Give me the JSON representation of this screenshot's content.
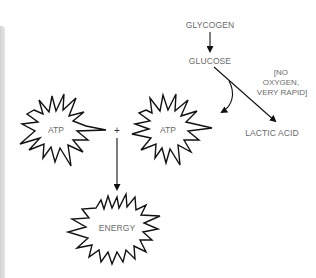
{
  "diagram": {
    "type": "metabolic-pathway",
    "nodes": {
      "glycogen": {
        "label": "GLYCOGEN"
      },
      "glucose": {
        "label": "GLUCOSE"
      },
      "condition": {
        "lines": [
          "[NO",
          "OXYGEN,",
          "VERY RAPID]"
        ]
      },
      "lactic_acid": {
        "label": "LACTIC ACID"
      },
      "atp_left": {
        "label": "ATP"
      },
      "atp_right": {
        "label": "ATP"
      },
      "plus": {
        "label": "+"
      },
      "energy": {
        "label": "ENERGY"
      }
    },
    "edges": [
      {
        "from": "GLYCOGEN",
        "to": "GLUCOSE"
      },
      {
        "from": "GLUCOSE",
        "to": "LACTIC ACID"
      },
      {
        "from": "GLUCOSE",
        "to": "ATP"
      },
      {
        "from": "ATP + ATP",
        "to": "ENERGY"
      }
    ],
    "colors": {
      "stroke": "#111111",
      "text": "#6a6a6a",
      "background": "#ffffff",
      "side_bar": "#d9d9d9"
    }
  }
}
